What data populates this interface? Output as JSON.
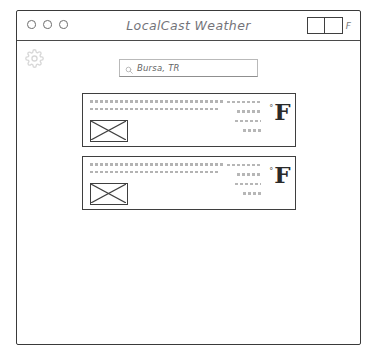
{
  "window": {
    "titlebar": {
      "title": "LocalCast Weather",
      "traffic_lights": [
        "close",
        "minimize",
        "maximize"
      ],
      "unit_toggle": {
        "icon": "toggle-switch",
        "state": "left",
        "label": "F"
      }
    }
  },
  "toolbar": {
    "settings_icon": "gear-icon"
  },
  "search": {
    "icon": "search-icon",
    "value": "Bursa, TR",
    "placeholder": "Enter city name"
  },
  "forecast": {
    "cards": [
      {
        "image_placeholder": "weather-icon-placeholder",
        "text_lines": [
          "placeholder-line-1",
          "placeholder-line-2"
        ],
        "detail_lines": [
          "detail-1",
          "detail-2",
          "detail-3",
          "detail-4"
        ],
        "degree_symbol": "°",
        "unit": "F"
      },
      {
        "image_placeholder": "weather-icon-placeholder",
        "text_lines": [
          "placeholder-line-1",
          "placeholder-line-2"
        ],
        "detail_lines": [
          "detail-1",
          "detail-2",
          "detail-3",
          "detail-4"
        ],
        "degree_symbol": "°",
        "unit": "F"
      }
    ]
  },
  "colors": {
    "stroke": "#3f3f3f",
    "background": "#ffffff",
    "muted_text": "#7b7b7b",
    "placeholder": "#9a9a9a"
  }
}
